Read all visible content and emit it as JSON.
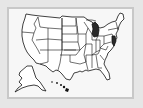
{
  "map": {
    "title": "United States map",
    "highlighted_states": [
      "Michigan",
      "New Jersey"
    ],
    "colors": {
      "background": "#e6e6e6",
      "frame_fill": "#f7f7f7",
      "frame_border": "#c8c8c8",
      "state_fill": "#ffffff",
      "state_stroke": "#111111",
      "highlight_fill": "#2a2a2a"
    },
    "insets": [
      "Alaska",
      "Hawaii"
    ]
  }
}
